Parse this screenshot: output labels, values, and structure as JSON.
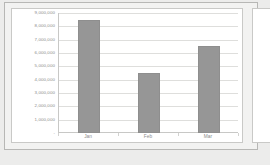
{
  "chart_data": {
    "type": "bar",
    "title": "",
    "subtitle": "",
    "xlabel": "",
    "ylabel": "",
    "categories": [
      "Jan",
      "Feb",
      "Mar"
    ],
    "values": [
      8500000,
      4500000,
      6500000
    ],
    "series": [
      {
        "name": "Series 1",
        "values": [
          8500000,
          4500000,
          6500000
        ]
      }
    ],
    "ylim": [
      0,
      9000000
    ],
    "ytick_values": [
      0,
      1000000,
      2000000,
      3000000,
      4000000,
      5000000,
      6000000,
      7000000,
      8000000,
      9000000
    ],
    "ytick_labels": [
      "-",
      "1,000,000",
      "2,000,000",
      "3,000,000",
      "4,000,000",
      "5,000,000",
      "6,000,000",
      "7,000,000",
      "8,000,000",
      "9,000,000"
    ],
    "grid": "horizontal",
    "legend": "none",
    "bar_color": "#969696",
    "gridline_color": "#dededc",
    "axis_color": "#c8c8c6",
    "tick_label_color": "#8c8c8c",
    "plot_background": "#ffffff",
    "page_background": "#ececeb"
  }
}
